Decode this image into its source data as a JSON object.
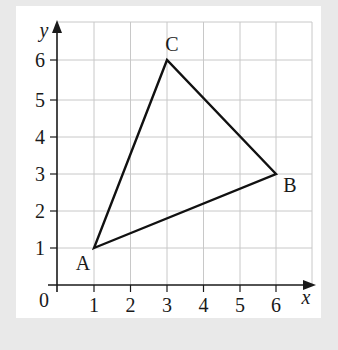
{
  "diagram": {
    "type": "coordinate-grid-triangle",
    "axes": {
      "x_label": "x",
      "y_label": "y",
      "origin_label": "0",
      "x_ticks": [
        "1",
        "2",
        "3",
        "4",
        "5",
        "6"
      ],
      "y_ticks": [
        "1",
        "2",
        "3",
        "4",
        "5",
        "6"
      ],
      "x_range": [
        0,
        6.9
      ],
      "y_range": [
        0,
        6.6
      ],
      "grid": true
    },
    "points": [
      {
        "label": "A",
        "x": 1,
        "y": 1
      },
      {
        "label": "B",
        "x": 6,
        "y": 3
      },
      {
        "label": "C",
        "x": 3,
        "y": 6
      }
    ],
    "polygon": [
      "A",
      "B",
      "C"
    ],
    "colors": {
      "background": "#e9e9e9",
      "panel": "#ffffff",
      "grid": "#c8c8c8",
      "lines": "#111111"
    }
  }
}
